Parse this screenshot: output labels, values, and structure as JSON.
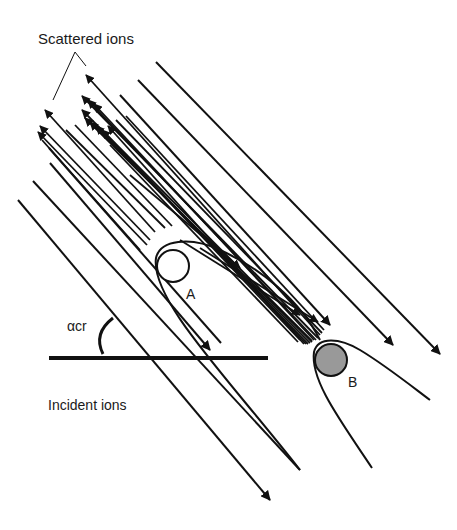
{
  "figure": {
    "labels": {
      "scattered_ions": "Scattered ions",
      "incident_ions": "Incident ions",
      "critical_angle": "αcr",
      "atom_a": "A",
      "atom_b": "B"
    },
    "atoms": [
      {
        "id": "A",
        "fill": "#ffffff",
        "cx": 173,
        "cy": 266,
        "r": 16
      },
      {
        "id": "B",
        "fill": "#999999",
        "cx": 331,
        "cy": 360,
        "r": 16
      }
    ],
    "colors": {
      "line": "#111111",
      "atom_b_fill": "#999999",
      "background": "#ffffff"
    }
  }
}
